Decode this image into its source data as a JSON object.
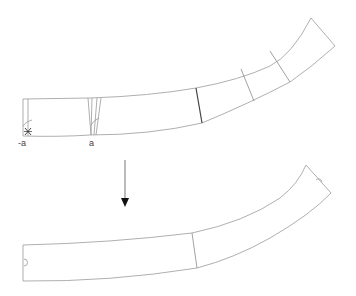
{
  "diagram": {
    "title": "",
    "top_strip": {
      "labels": {
        "left_marker": "-a",
        "cut_marker": "a"
      },
      "segments": 5
    },
    "arrow": {
      "direction": "down"
    },
    "bottom_strip": {
      "segments": 2
    },
    "colors": {
      "outline": "#9a9a9a",
      "arrow": "#111111"
    }
  }
}
